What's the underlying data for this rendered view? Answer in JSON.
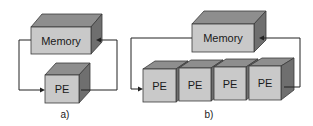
{
  "diagram": {
    "panels": [
      {
        "caption": "a)",
        "memory_label": "Memory",
        "processing_elements": [
          "PE"
        ]
      },
      {
        "caption": "b)",
        "memory_label": "Memory",
        "processing_elements": [
          "PE",
          "PE",
          "PE",
          "PE"
        ]
      }
    ],
    "colors": {
      "front_face": "#c9c9c9",
      "top_face": "#8e8e8e",
      "side_face": "#6f6f6f",
      "wire": "#222222"
    }
  }
}
